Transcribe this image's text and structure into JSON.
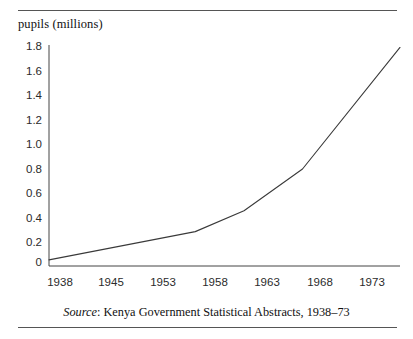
{
  "figure": {
    "y_axis_caption": "pupils (millions)",
    "source_prefix": "Source",
    "source_separator": ": ",
    "source_text": "Kenya Government Statistical Abstracts, 1938–73",
    "line_color": "#3a3a3a",
    "axis_color": "#444444",
    "rule_color": "#555555",
    "background": "#ffffff"
  },
  "chart_data": {
    "type": "line",
    "title": "",
    "subtitle": "",
    "xlabel": "",
    "ylabel": "pupils (millions)",
    "grid": false,
    "legend": "none",
    "x_tick_labels": [
      "1938",
      "1945",
      "1953",
      "1958",
      "1963",
      "1968",
      "1973"
    ],
    "x_tick_values": [
      1938,
      1945,
      1953,
      1958,
      1963,
      1968,
      1973
    ],
    "y_tick_labels": [
      "1.8",
      "1.6",
      "1.4",
      "1.2",
      "1.0",
      "0.8",
      "0.6",
      "0.4",
      "0.2",
      "0"
    ],
    "y_tick_values": [
      1.8,
      1.6,
      1.4,
      1.2,
      1.0,
      0.8,
      0.6,
      0.4,
      0.2,
      0
    ],
    "xlim": [
      1938,
      1974
    ],
    "ylim": [
      0,
      1.8
    ],
    "series": [
      {
        "name": "pupils (millions)",
        "x": [
          1938,
          1953,
          1958,
          1964,
          1974
        ],
        "values": [
          0.05,
          0.28,
          0.45,
          0.79,
          1.78
        ]
      }
    ],
    "annotations": [],
    "source": "Source: Kenya Government Statistical Abstracts, 1938–73"
  },
  "axis_geometry": {
    "plot_left": 49,
    "plot_right": 400,
    "plot_top": 45,
    "plot_bottom": 266,
    "x_tick_pixel_centers": [
      60,
      111,
      163,
      215,
      267,
      320,
      372
    ],
    "y_tick_pixel_centers": [
      47,
      71.5,
      96,
      120.5,
      145,
      169.5,
      194,
      218.5,
      243,
      263
    ]
  }
}
